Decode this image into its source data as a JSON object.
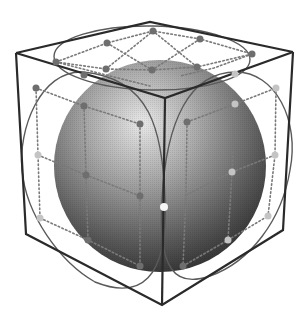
{
  "diagram": {
    "title": "Sphere inscribed in a cube with tangent circles on each face",
    "colors": {
      "background": "#ffffff",
      "cube_edge": "#2a2a2a",
      "face_circle": "#5a5a5a",
      "grid_dotted": "#7a7a7a",
      "sphere_light": "#e6e6e6",
      "sphere_dark": "#2e2e2e",
      "point_dark": "#6e6e6e",
      "point_light": "#c4c4c4",
      "point_white": "#f5f5f5"
    },
    "cube_vertices": {
      "top_back": [
        150,
        22
      ],
      "top_left": [
        16,
        53
      ],
      "top_right": [
        293,
        52
      ],
      "top_front": [
        165,
        98
      ],
      "bottom_left": [
        26,
        234
      ],
      "bottom_right": [
        283,
        230
      ],
      "bottom_front": [
        162,
        305
      ]
    },
    "elements": [
      "cube",
      "sphere",
      "face-circles",
      "dotted-grid",
      "tangent-points"
    ]
  }
}
